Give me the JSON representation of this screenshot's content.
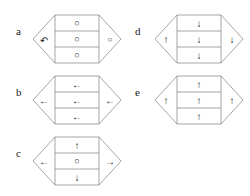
{
  "diagram": {
    "stroke_color": "#808080",
    "glyph_color": "#161616",
    "background_color": "#ffffff",
    "panels": [
      {
        "id": "panel-a",
        "label": "a",
        "left_point": {
          "name": "loop-arrow-icon",
          "symbol": "↶"
        },
        "right_point": {
          "name": "circle-icon",
          "symbol": "○"
        },
        "rows": [
          {
            "name": "circle-icon",
            "symbol": "○"
          },
          {
            "name": "circle-icon",
            "symbol": "○"
          },
          {
            "name": "circle-icon",
            "symbol": "○"
          }
        ]
      },
      {
        "id": "panel-b",
        "label": "b",
        "left_point": {
          "name": "arrow-left-icon",
          "symbol": "←"
        },
        "right_point": {
          "name": "arrow-left-icon",
          "symbol": "←"
        },
        "rows": [
          {
            "name": "arrow-left-icon",
            "symbol": "←"
          },
          {
            "name": "arrow-left-icon",
            "symbol": "←"
          },
          {
            "name": "arrow-left-icon",
            "symbol": "←"
          }
        ]
      },
      {
        "id": "panel-c",
        "label": "c",
        "left_point": {
          "name": "arrow-left-icon",
          "symbol": "←"
        },
        "right_point": {
          "name": "arrow-right-icon",
          "symbol": "→"
        },
        "rows": [
          {
            "name": "arrow-up-icon",
            "symbol": "↑"
          },
          {
            "name": "circle-icon",
            "symbol": "○"
          },
          {
            "name": "arrow-down-icon",
            "symbol": "↓"
          }
        ]
      },
      {
        "id": "panel-d",
        "label": "d",
        "left_point": {
          "name": "arrow-up-icon",
          "symbol": "↑"
        },
        "right_point": {
          "name": "arrow-down-icon",
          "symbol": "↓"
        },
        "rows": [
          {
            "name": "arrow-down-icon",
            "symbol": "↓"
          },
          {
            "name": "arrow-down-icon",
            "symbol": "↓"
          },
          {
            "name": "arrow-down-icon",
            "symbol": "↓"
          }
        ]
      },
      {
        "id": "panel-e",
        "label": "e",
        "left_point": {
          "name": "arrow-up-icon",
          "symbol": "↑"
        },
        "right_point": {
          "name": "arrow-up-icon",
          "symbol": "↑"
        },
        "rows": [
          {
            "name": "arrow-up-icon",
            "symbol": "↑"
          },
          {
            "name": "arrow-up-icon",
            "symbol": "↑"
          },
          {
            "name": "arrow-up-icon",
            "symbol": "↑"
          }
        ]
      }
    ]
  }
}
